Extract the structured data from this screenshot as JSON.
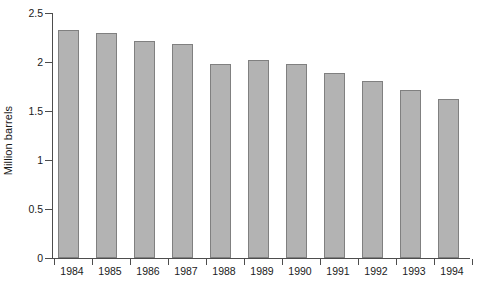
{
  "chart_data": {
    "type": "bar",
    "title": "",
    "subtitle": "",
    "xlabel": "",
    "ylabel": "Million barrels",
    "categories": [
      "1984",
      "1985",
      "1986",
      "1987",
      "1988",
      "1989",
      "1990",
      "1991",
      "1992",
      "1993",
      "1994"
    ],
    "values": [
      2.33,
      2.3,
      2.21,
      2.18,
      1.98,
      2.02,
      1.98,
      1.89,
      1.81,
      1.71,
      1.62
    ],
    "series": [
      {
        "name": "Million barrels",
        "values": [
          2.33,
          2.3,
          2.21,
          2.18,
          1.98,
          2.02,
          1.98,
          1.89,
          1.81,
          1.71,
          1.62
        ]
      }
    ],
    "ylim": [
      0,
      2.5
    ],
    "yticks": [
      0,
      0.5,
      1,
      1.5,
      2,
      2.5
    ],
    "ytick_labels": [
      "0",
      "0.5",
      "1",
      "1.5",
      "2",
      "2.5"
    ],
    "grid": false,
    "legend": false,
    "legend_position": "none",
    "annotations": [],
    "colors": {
      "bar_fill": "#b3b3b3",
      "bar_border": "#808080",
      "axis": "#4d4d4d",
      "text": "#1a1a1a",
      "background": "#ffffff"
    }
  }
}
